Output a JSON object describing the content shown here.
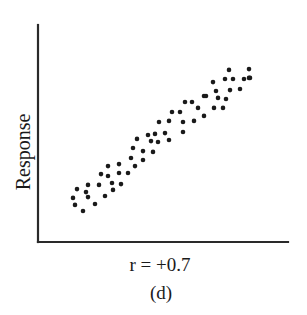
{
  "chart_data": {
    "type": "scatter",
    "title": "",
    "xlabel": "",
    "ylabel": "Response",
    "annotation": "r = +0.7",
    "panel_label": "(d)",
    "xlim": [
      0,
      100
    ],
    "ylim": [
      0,
      100
    ],
    "grid": false,
    "legend": null,
    "ticks": {
      "x": [],
      "y": []
    },
    "points": [
      [
        14.0,
        20.3
      ],
      [
        14.8,
        17.1
      ],
      [
        15.6,
        24.4
      ],
      [
        18.0,
        14.3
      ],
      [
        19.2,
        23.0
      ],
      [
        20.0,
        26.3
      ],
      [
        20.0,
        20.7
      ],
      [
        22.8,
        17.5
      ],
      [
        24.4,
        26.3
      ],
      [
        26.8,
        21.2
      ],
      [
        25.2,
        31.3
      ],
      [
        28.0,
        35.0
      ],
      [
        28.0,
        30.4
      ],
      [
        29.6,
        27.2
      ],
      [
        30.0,
        24.0
      ],
      [
        32.4,
        35.9
      ],
      [
        32.4,
        31.8
      ],
      [
        33.2,
        26.7
      ],
      [
        36.0,
        31.8
      ],
      [
        37.2,
        38.7
      ],
      [
        38.0,
        43.3
      ],
      [
        38.8,
        35.0
      ],
      [
        39.6,
        47.5
      ],
      [
        42.0,
        41.9
      ],
      [
        42.0,
        37.8
      ],
      [
        44.0,
        49.3
      ],
      [
        45.2,
        46.5
      ],
      [
        46.0,
        41.5
      ],
      [
        46.8,
        49.8
      ],
      [
        48.0,
        46.1
      ],
      [
        50.8,
        50.2
      ],
      [
        52.4,
        47.0
      ],
      [
        48.4,
        55.3
      ],
      [
        52.4,
        55.8
      ],
      [
        53.6,
        59.9
      ],
      [
        56.8,
        59.9
      ],
      [
        58.0,
        55.3
      ],
      [
        58.0,
        50.7
      ],
      [
        62.4,
        55.8
      ],
      [
        58.8,
        64.5
      ],
      [
        61.6,
        64.5
      ],
      [
        64.0,
        61.8
      ],
      [
        66.4,
        67.3
      ],
      [
        66.4,
        58.1
      ],
      [
        67.2,
        67.3
      ],
      [
        70.0,
        73.7
      ],
      [
        70.4,
        61.8
      ],
      [
        71.2,
        69.6
      ],
      [
        72.0,
        66.4
      ],
      [
        74.0,
        61.8
      ],
      [
        74.8,
        75.1
      ],
      [
        75.2,
        65.9
      ],
      [
        76.4,
        79.3
      ],
      [
        76.8,
        70.0
      ],
      [
        78.0,
        75.1
      ],
      [
        80.8,
        70.5
      ],
      [
        82.4,
        75.1
      ],
      [
        84.4,
        75.6
      ],
      [
        84.4,
        79.7
      ],
      [
        84.8,
        75.6
      ]
    ],
    "marker": {
      "shape": "circle",
      "radius_px": 2.3,
      "color": "#1a1a1a"
    }
  },
  "axes": {
    "color": "#2a2a2a",
    "origin_px": [
      38,
      242
    ],
    "x_end_px": 288,
    "y_top_px": 25
  },
  "labels": {
    "ylabel": "Response",
    "correlation": "r = +0.7",
    "panel": "(d)"
  }
}
